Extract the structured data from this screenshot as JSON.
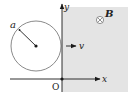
{
  "diagram": {
    "title": "",
    "labels": {
      "radius": "a",
      "velocity": "v",
      "field": "B",
      "origin": "O",
      "x_axis": "x",
      "y_axis": "y"
    },
    "field_direction": "into-page",
    "field_symbol": "⊗",
    "region": "x > 0 (shaded, magnetic field)",
    "colors": {
      "field_region": "#e4e4e4",
      "circle": "#8a8a8a",
      "ink": "#1a1a1a"
    }
  }
}
